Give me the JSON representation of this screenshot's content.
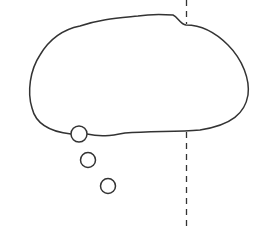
{
  "diagram": {
    "colors": {
      "stroke": "#333333",
      "background": "#ffffff"
    },
    "bubble": {
      "shape": "cloud"
    },
    "trail_circles": [
      {
        "cx": 79,
        "cy": 134,
        "r": 8
      },
      {
        "cx": 88,
        "cy": 160,
        "r": 7.5
      },
      {
        "cx": 108,
        "cy": 186,
        "r": 7.5
      }
    ],
    "dashed_line": {
      "x": 186
    }
  }
}
